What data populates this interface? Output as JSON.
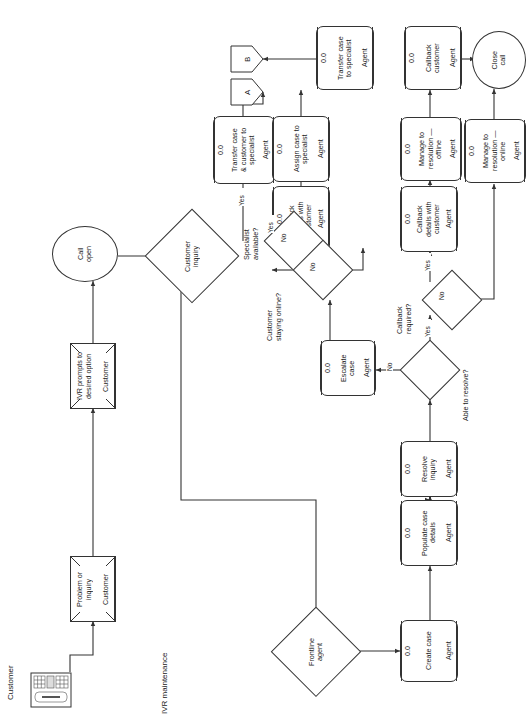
{
  "diagram": {
    "orientation": "rotated-90-ccw",
    "line_color": "#333333",
    "fill_color": "#ffffff",
    "text_color": "#1a1a1a"
  },
  "captions": {
    "customer_lane": "Customer",
    "ivr_lane": "IVR maintenance"
  },
  "entities": {
    "customer_device": {
      "icon": "keyboard-icon",
      "label": "Customer"
    }
  },
  "terminators": {
    "call_open": "Call\nopen",
    "close_call": "Close\ncall"
  },
  "connectors": {
    "a": "A",
    "b": "B"
  },
  "decisions": {
    "customer_inquiry": "Customer\ninquiry",
    "frontline_agent": "Frontline\nagent",
    "specialist_available": "Specialist\navailable?",
    "customer_staying_online": "Customer\nstaying online?",
    "callback_required": "Callback\nrequired?",
    "able_to_resolve": "Able to resolve?"
  },
  "processes": [
    {
      "key": "problem_or_inquiry",
      "id": "",
      "title": "Problem or\ninquiry",
      "role": "Customer",
      "shape": "manual-operation"
    },
    {
      "key": "ivr_prompts",
      "id": "",
      "title": "IVR prompts to\ndesired option",
      "role": "Customer",
      "shape": "manual-operation"
    },
    {
      "key": "create_case",
      "id": "0.0",
      "title": "Create case",
      "role": "Agent",
      "shape": "process"
    },
    {
      "key": "populate_case_details",
      "id": "0.0",
      "title": "Populate case\ndetails",
      "role": "Agent",
      "shape": "process"
    },
    {
      "key": "resolve_inquiry",
      "id": "0.0",
      "title": "Resolve\ninquiry",
      "role": "Agent",
      "shape": "process"
    },
    {
      "key": "escalate_case",
      "id": "0.0",
      "title": "Escalate\ncase",
      "role": "Agent",
      "shape": "process"
    },
    {
      "key": "callback_details_1",
      "id": "0.0",
      "title": "Callback\ndetails with\ncustomer",
      "role": "Agent",
      "shape": "process"
    },
    {
      "key": "callback_details_2",
      "id": "0.0",
      "title": "Callback\ndetails with\ncustomer",
      "role": "Agent",
      "shape": "process"
    },
    {
      "key": "transfer_case_customer",
      "id": "0.0",
      "title": "Transfer case\n& customer to\nspecialist",
      "role": "Agent",
      "shape": "process"
    },
    {
      "key": "assign_case_specialist",
      "id": "0.0",
      "title": "Assign case to\nspecialist",
      "role": "Agent",
      "shape": "process"
    },
    {
      "key": "transfer_case_specialist",
      "id": "0.0",
      "title": "Transfer case\nto specialist",
      "role": "Agent",
      "shape": "process"
    },
    {
      "key": "callback_customer",
      "id": "0.0",
      "title": "Callback\ncustomer",
      "role": "Agent",
      "shape": "process"
    },
    {
      "key": "manage_offline",
      "id": "0.0",
      "title": "Manage to\nresolution —\noffline",
      "role": "Agent",
      "shape": "process"
    },
    {
      "key": "manage_online",
      "id": "0.0",
      "title": "Manage to\nresolution —\nonline",
      "role": "Agent",
      "shape": "process"
    }
  ],
  "edge_labels": {
    "specialist_yes": "Yes",
    "specialist_no": "No",
    "staying_online_yes": "Yes",
    "staying_online_no": "No",
    "callback_yes": "Yes",
    "callback_no": "No",
    "resolve_yes": "Yes",
    "resolve_no": "No"
  }
}
